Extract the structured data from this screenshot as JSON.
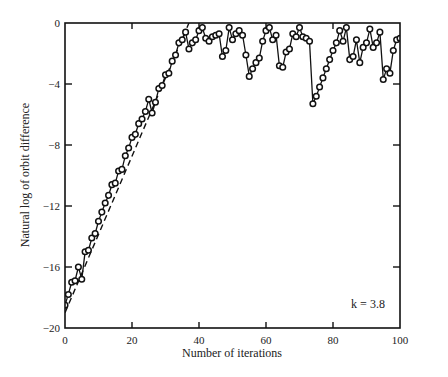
{
  "chart_data": {
    "type": "line",
    "title": "",
    "xlabel": "Number of iterations",
    "ylabel": "Natural log of orbit difference",
    "xlim": [
      0,
      100
    ],
    "ylim": [
      -20,
      0
    ],
    "xticks": [
      0,
      20,
      40,
      60,
      80,
      100
    ],
    "yticks": [
      0,
      -4,
      -8,
      -12,
      -16,
      -20
    ],
    "grid": false,
    "legend": null,
    "annotation": "k = 3.8",
    "series": [
      {
        "name": "orbit difference",
        "style": "line-with-circle-markers",
        "x": [
          0,
          1,
          2,
          3,
          4,
          5,
          6,
          7,
          8,
          9,
          10,
          11,
          12,
          13,
          14,
          15,
          16,
          17,
          18,
          19,
          20,
          21,
          22,
          23,
          24,
          25,
          26,
          27,
          28,
          29,
          30,
          31,
          32,
          33,
          34,
          35,
          36,
          37,
          38,
          39,
          40,
          41,
          42,
          43,
          44,
          45,
          46,
          47,
          48,
          49,
          50,
          51,
          52,
          53,
          54,
          55,
          56,
          57,
          58,
          59,
          60,
          61,
          62,
          63,
          64,
          65,
          66,
          67,
          68,
          69,
          70,
          71,
          72,
          73,
          74,
          75,
          76,
          77,
          78,
          79,
          80,
          81,
          82,
          83,
          84,
          85,
          86,
          87,
          88,
          89,
          90,
          91,
          92,
          93,
          94,
          95,
          96,
          97,
          98,
          99,
          100
        ],
        "y": [
          -18.5,
          -17.8,
          -17.0,
          -16.9,
          -16.0,
          -16.8,
          -15.0,
          -14.9,
          -14.1,
          -13.8,
          -13.0,
          -12.4,
          -11.8,
          -11.3,
          -10.6,
          -10.5,
          -9.7,
          -9.6,
          -8.7,
          -8.2,
          -7.5,
          -7.3,
          -6.6,
          -6.3,
          -5.8,
          -5.0,
          -5.9,
          -5.2,
          -4.3,
          -4.1,
          -3.4,
          -3.3,
          -2.5,
          -2.1,
          -1.3,
          -1.1,
          -0.6,
          -1.7,
          -1.3,
          -1.1,
          -0.5,
          -0.3,
          -1.0,
          -1.2,
          -0.9,
          -0.8,
          -0.7,
          -2.2,
          -1.8,
          -0.3,
          -1.1,
          -0.7,
          -0.5,
          -0.8,
          -2.1,
          -3.5,
          -3.0,
          -2.6,
          -2.3,
          -1.2,
          -0.5,
          -0.3,
          -1.1,
          -0.8,
          -2.8,
          -2.9,
          -1.9,
          -1.7,
          -0.7,
          -0.9,
          -0.3,
          -0.9,
          -1.0,
          -1.2,
          -5.3,
          -4.8,
          -4.2,
          -3.6,
          -3.0,
          -2.4,
          -1.8,
          -1.3,
          -0.5,
          -1.2,
          -0.3,
          -2.4,
          -2.2,
          -1.1,
          -2.6,
          -1.6,
          -1.3,
          -0.4,
          -1.6,
          -1.3,
          -0.6,
          -3.7,
          -3.0,
          -3.3,
          -1.8,
          -1.1,
          -1.0
        ]
      },
      {
        "name": "exponential trend",
        "style": "dashed",
        "x": [
          0,
          37
        ],
        "y": [
          -19.0,
          0
        ]
      }
    ]
  },
  "plot": {
    "x_axis_label": "Number of iterations",
    "y_axis_label": "Natural log of orbit difference",
    "annotation": "k = 3.8",
    "x_tick_labels": [
      "0",
      "20",
      "40",
      "60",
      "80",
      "100"
    ],
    "y_tick_labels": [
      "0",
      "-4",
      "-8",
      "-12",
      "-16",
      "-20"
    ]
  }
}
